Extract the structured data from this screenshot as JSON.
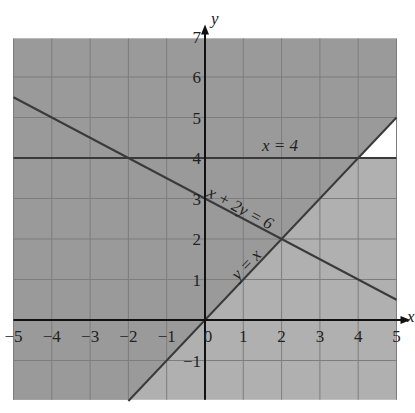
{
  "chart_data": {
    "type": "line",
    "title": "",
    "xlabel": "x",
    "ylabel": "y",
    "xlim": [
      -5,
      5
    ],
    "ylim": [
      -2,
      7
    ],
    "grid": true,
    "x_ticks": [
      "-5",
      "-4",
      "-3",
      "-2",
      "-1",
      "0",
      "1",
      "2",
      "3",
      "4",
      "5"
    ],
    "y_ticks": [
      "-1",
      "1",
      "2",
      "3",
      "4",
      "5",
      "6",
      "7"
    ],
    "series": [
      {
        "name": "x = 4",
        "label": "x = 4",
        "kind": "horizontal",
        "points": [
          [
            -5,
            4
          ],
          [
            5,
            4
          ]
        ]
      },
      {
        "name": "x + 2y = 6",
        "label": "x + 2y = 6",
        "points": [
          [
            -5,
            5.5
          ],
          [
            5,
            0.5
          ]
        ]
      },
      {
        "name": "y = x",
        "label": "y = x",
        "points": [
          [
            -2,
            -2
          ],
          [
            5,
            5
          ]
        ]
      }
    ],
    "regions": [
      {
        "name": "above y = x",
        "shade": "dark",
        "color": "#9a9a9a"
      },
      {
        "name": "below y = x and below y = 4",
        "shade": "medium",
        "color": "#b0b0b0"
      },
      {
        "name": "below y = x and above y = 4",
        "shade": "unshaded",
        "color": "#ffffff"
      }
    ],
    "intersections": [
      [
        -2,
        4
      ],
      [
        2,
        2
      ],
      [
        4,
        4
      ],
      [
        4,
        1
      ]
    ]
  },
  "labels": {
    "x_axis": "x",
    "y_axis": "y",
    "line_h": "x = 4",
    "line_a": "x + 2y = 6",
    "line_b": "y = x"
  }
}
